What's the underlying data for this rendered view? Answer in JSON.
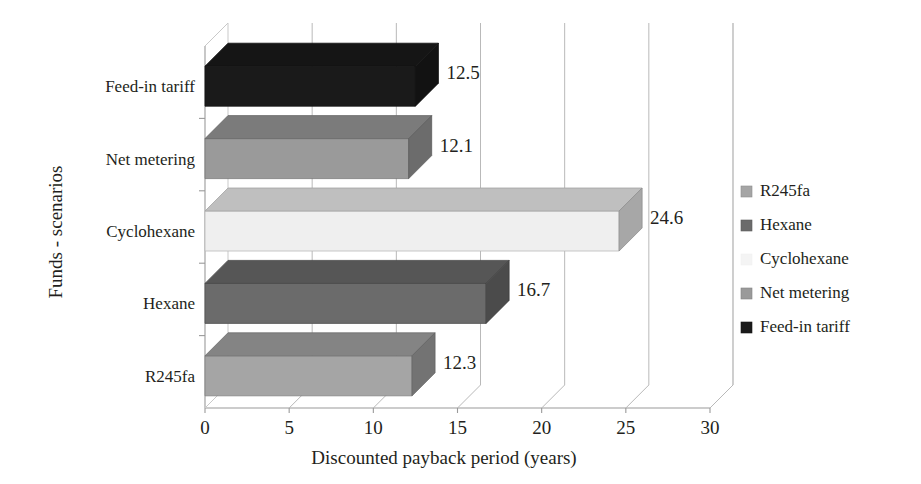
{
  "chart_data": {
    "type": "bar",
    "orientation": "horizontal",
    "style": "3d",
    "title": "",
    "xlabel": "Discounted payback period (years)",
    "ylabel": "Funds - scenarios",
    "categories": [
      "R245fa",
      "Hexane",
      "Cyclohexane",
      "Net metering",
      "Feed-in tariff"
    ],
    "values": [
      12.3,
      16.7,
      24.6,
      12.1,
      12.5
    ],
    "value_labels": [
      "12.3",
      "16.7",
      "24.6",
      "12.1",
      "12.5"
    ],
    "bar_colors": [
      "#a5a5a5",
      "#6b6b6b",
      "#efefef",
      "#9a9a9a",
      "#1a1a1a"
    ],
    "xlim": [
      0,
      30
    ],
    "xticks": [
      0,
      5,
      10,
      15,
      20,
      25,
      30
    ],
    "xtick_labels": [
      "0",
      "5",
      "10",
      "15",
      "20",
      "25",
      "30"
    ],
    "grid": true,
    "grid_axis": "x",
    "legend_position": "right",
    "legend_entries": [
      {
        "label": "R245fa",
        "color": "#a5a5a5"
      },
      {
        "label": "Hexane",
        "color": "#6b6b6b"
      },
      {
        "label": "Cyclohexane",
        "color": "#f4f4f4"
      },
      {
        "label": "Net metering",
        "color": "#9a9a9a"
      },
      {
        "label": "Feed-in tariff",
        "color": "#1a1a1a"
      }
    ]
  },
  "axes": {
    "x_title": "Discounted payback period (years)",
    "y_title": "Funds - scenarios"
  },
  "bars": [
    {
      "category": "Feed-in tariff",
      "value_label": "12.5"
    },
    {
      "category": "Net metering",
      "value_label": "12.1"
    },
    {
      "category": "Cyclohexane",
      "value_label": "24.6"
    },
    {
      "category": "Hexane",
      "value_label": "16.7"
    },
    {
      "category": "R245fa",
      "value_label": "12.3"
    }
  ],
  "xticks": [
    {
      "label": "0"
    },
    {
      "label": "5"
    },
    {
      "label": "10"
    },
    {
      "label": "15"
    },
    {
      "label": "20"
    },
    {
      "label": "25"
    },
    {
      "label": "30"
    }
  ],
  "legend": {
    "items": [
      {
        "label": "R245fa"
      },
      {
        "label": "Hexane"
      },
      {
        "label": "Cyclohexane"
      },
      {
        "label": "Net metering"
      },
      {
        "label": "Feed-in tariff"
      }
    ]
  }
}
